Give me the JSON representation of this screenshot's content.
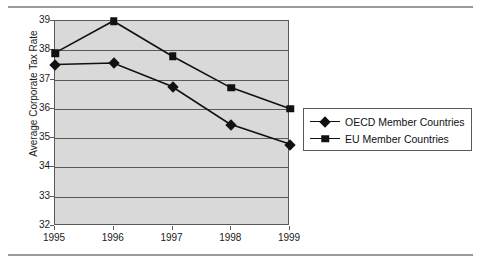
{
  "chart_data": {
    "type": "line",
    "title": "",
    "xlabel": "",
    "ylabel": "Average Corporate Tax Rate",
    "categories": [
      "1995",
      "1996",
      "1997",
      "1998",
      "1999"
    ],
    "x": [
      1995,
      1996,
      1997,
      1998,
      1999
    ],
    "ylim": [
      32,
      39
    ],
    "yticks": [
      32,
      33,
      34,
      35,
      36,
      37,
      38,
      39
    ],
    "grid": "horizontal",
    "legend_position": "right",
    "series": [
      {
        "name": "OECD Member Countries",
        "marker": "diamond",
        "color": "#111111",
        "values": [
          37.5,
          37.55,
          36.75,
          35.45,
          34.78
        ]
      },
      {
        "name": "EU Member Countries",
        "marker": "square",
        "color": "#111111",
        "values": [
          37.9,
          39.0,
          37.8,
          36.72,
          36.0
        ]
      }
    ]
  },
  "axes": {
    "y_title": "Average Corporate Tax Rate",
    "y_tick_labels": [
      "39",
      "38",
      "37",
      "36",
      "35",
      "34",
      "33",
      "32"
    ],
    "x_tick_labels": [
      "1995",
      "1996",
      "1997",
      "1998",
      "1999"
    ]
  },
  "legend": {
    "entries": [
      {
        "label": "OECD Member Countries",
        "marker": "diamond-marker"
      },
      {
        "label": "EU Member Countries",
        "marker": "square-marker"
      }
    ]
  },
  "colors": {
    "plot_background": "#d9d9d9",
    "gridline": "#595959",
    "series_line": "#111111",
    "rule": "#9a9a9a",
    "page_background": "#ffffff"
  }
}
